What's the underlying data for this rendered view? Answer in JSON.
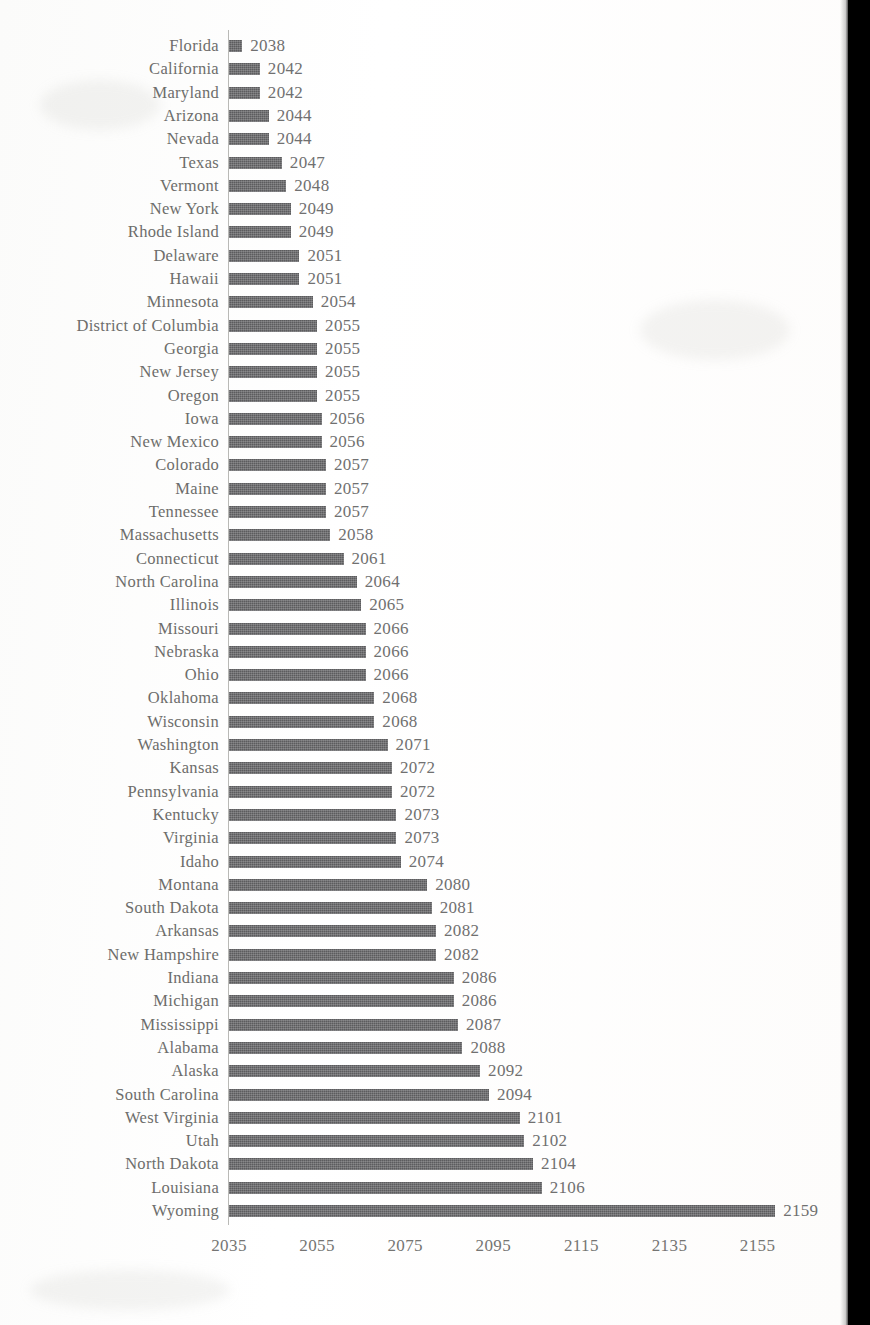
{
  "chart_data": {
    "type": "bar",
    "orientation": "horizontal",
    "title": "",
    "subtitle": "",
    "xlabel": "",
    "ylabel": "",
    "grid": false,
    "legend": null,
    "xlim": [
      2035,
      2162
    ],
    "xticks": [
      2035,
      2055,
      2075,
      2095,
      2115,
      2135,
      2155
    ],
    "xtick_labels": [
      "2035",
      "2055",
      "2075",
      "2095",
      "2115",
      "2135",
      "2155"
    ],
    "value_labels_shown": true,
    "bar_color": "#5c5c5e",
    "axis_color": "#b9b9b6",
    "text_color": "#6d6d6b",
    "background_color": "#fdfdfc",
    "baseline": 2035,
    "categories": [
      "Florida",
      "California",
      "Maryland",
      "Arizona",
      "Nevada",
      "Texas",
      "Vermont",
      "New York",
      "Rhode Island",
      "Delaware",
      "Hawaii",
      "Minnesota",
      "District of Columbia",
      "Georgia",
      "New Jersey",
      "Oregon",
      "Iowa",
      "New Mexico",
      "Colorado",
      "Maine",
      "Tennessee",
      "Massachusetts",
      "Connecticut",
      "North Carolina",
      "Illinois",
      "Missouri",
      "Nebraska",
      "Ohio",
      "Oklahoma",
      "Wisconsin",
      "Washington",
      "Kansas",
      "Pennsylvania",
      "Kentucky",
      "Virginia",
      "Idaho",
      "Montana",
      "South Dakota",
      "Arkansas",
      "New Hampshire",
      "Indiana",
      "Michigan",
      "Mississippi",
      "Alabama",
      "Alaska",
      "South Carolina",
      "West Virginia",
      "Utah",
      "North Dakota",
      "Louisiana",
      "Wyoming"
    ],
    "values": [
      2038,
      2042,
      2042,
      2044,
      2044,
      2047,
      2048,
      2049,
      2049,
      2051,
      2051,
      2054,
      2055,
      2055,
      2055,
      2055,
      2056,
      2056,
      2057,
      2057,
      2057,
      2058,
      2061,
      2064,
      2065,
      2066,
      2066,
      2066,
      2068,
      2068,
      2071,
      2072,
      2072,
      2073,
      2073,
      2074,
      2080,
      2081,
      2082,
      2082,
      2086,
      2086,
      2087,
      2088,
      2092,
      2094,
      2101,
      2102,
      2104,
      2106,
      2159
    ],
    "value_label_strings": [
      "2038",
      "2042",
      "2042",
      "2044",
      "2044",
      "2047",
      "2048",
      "2049",
      "2049",
      "2051",
      "2051",
      "2054",
      "2055",
      "2055",
      "2055",
      "2055",
      "2056",
      "2056",
      "2057",
      "2057",
      "2057",
      "2058",
      "2061",
      "2064",
      "2065",
      "2066",
      "2066",
      "2066",
      "2068",
      "2068",
      "2071",
      "2072",
      "2072",
      "2073",
      "2073",
      "2074",
      "2080",
      "2081",
      "2082",
      "2082",
      "2086",
      "2086",
      "2087",
      "2088",
      "2092",
      "2094",
      "2101",
      "2102",
      "2104",
      "2106",
      "2159"
    ]
  }
}
